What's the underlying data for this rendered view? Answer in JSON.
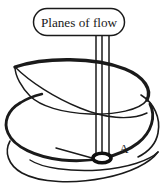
{
  "figure": {
    "name": "planes-of-flow-helix-diagram",
    "type": "line-drawing",
    "width": 165,
    "height": 193,
    "background_color": "#ffffff",
    "ink_color": "#1a1a1a"
  },
  "callout": {
    "label": "Planes of flow",
    "shape": "rounded-rectangle",
    "box": {
      "x": 33,
      "y": 8,
      "width": 92,
      "height": 28,
      "corner_radius": 14
    },
    "text_anchor": {
      "x": 79,
      "y": 27
    }
  },
  "plane_lines": {
    "count": 3,
    "orientation": "vertical",
    "x_positions": [
      96,
      102,
      109
    ],
    "y_top": 36,
    "y_bottom": 157
  },
  "point_marker": {
    "label": "A",
    "marker_shape": "ellipse",
    "marker": {
      "cx": 102,
      "cy": 158,
      "rx": 9,
      "ry": 5
    },
    "label_anchor": {
      "x": 124,
      "y": 153
    }
  },
  "helix": {
    "description": "spiral flow path, three descending loops",
    "stroke_color": "#1a1a1a",
    "loops": 3
  }
}
